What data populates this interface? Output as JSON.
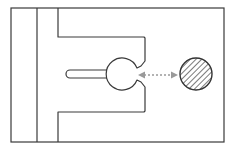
{
  "diagram": {
    "colors": {
      "outline": "#3a3a3a",
      "arrow": "#9a9a9a",
      "hatch": "#333333",
      "background": "#ffffff"
    },
    "elements": [
      {
        "name": "outer-frame"
      },
      {
        "name": "keyhole-slot"
      },
      {
        "name": "dotted-double-arrow"
      },
      {
        "name": "hatched-circle"
      }
    ]
  }
}
